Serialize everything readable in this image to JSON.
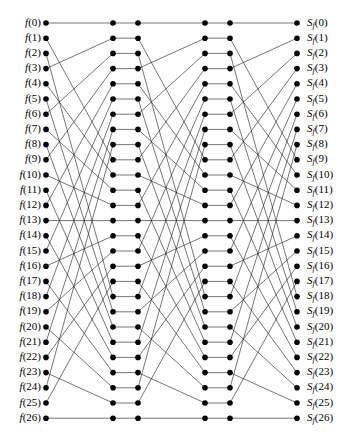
{
  "figure": {
    "width": 363,
    "height": 442,
    "background_color": "#ffffff",
    "node_color": "#000000",
    "edge_color": "#1a1a1a"
  },
  "diagram": {
    "node_count_per_column": 27,
    "column_count": 6,
    "stage_count": 3,
    "column_x": [
      46,
      113,
      138,
      205,
      230,
      297
    ],
    "row_y_first": 23,
    "row_y_spacing": 15.2,
    "node_radius": 2.8,
    "edge_width": 0.6,
    "stage_permutation_name": "stride-3 / base-3 digit shuffle",
    "stage_permutation": [
      0,
      9,
      18,
      1,
      10,
      19,
      2,
      11,
      20,
      3,
      12,
      21,
      4,
      13,
      22,
      5,
      14,
      23,
      6,
      15,
      24,
      7,
      16,
      25,
      8,
      17,
      26
    ]
  },
  "left_labels": {
    "symbol": "f",
    "items": [
      "f(0)",
      "f(1)",
      "f(2)",
      "f(3)",
      "f(4)",
      "f(5)",
      "f(6)",
      "f(7)",
      "f(8)",
      "f(9)",
      "f(10)",
      "f(11)",
      "f(12)",
      "f(13)",
      "f(14)",
      "f(15)",
      "f(16)",
      "f(17)",
      "f(18)",
      "f(19)",
      "f(20)",
      "f(21)",
      "f(22)",
      "f(23)",
      "f(24)",
      "f(25)",
      "f(26)"
    ],
    "indices": [
      0,
      1,
      2,
      3,
      4,
      5,
      6,
      7,
      8,
      9,
      10,
      11,
      12,
      13,
      14,
      15,
      16,
      17,
      18,
      19,
      20,
      21,
      22,
      23,
      24,
      25,
      26
    ]
  },
  "right_labels": {
    "symbol": "S",
    "subscript": "f",
    "items": [
      "S_f(0)",
      "S_f(1)",
      "S_f(2)",
      "S_f(3)",
      "S_f(4)",
      "S_f(5)",
      "S_f(6)",
      "S_f(7)",
      "S_f(8)",
      "S_f(9)",
      "S_f(10)",
      "S_f(11)",
      "S_f(12)",
      "S_f(13)",
      "S_f(14)",
      "S_f(15)",
      "S_f(16)",
      "S_f(17)",
      "S_f(18)",
      "S_f(19)",
      "S_f(20)",
      "S_f(21)",
      "S_f(22)",
      "S_f(23)",
      "S_f(24)",
      "S_f(25)",
      "S_f(26)"
    ],
    "indices": [
      0,
      1,
      2,
      3,
      4,
      5,
      6,
      7,
      8,
      9,
      10,
      11,
      12,
      13,
      14,
      15,
      16,
      17,
      18,
      19,
      20,
      21,
      22,
      23,
      24,
      25,
      26
    ]
  }
}
